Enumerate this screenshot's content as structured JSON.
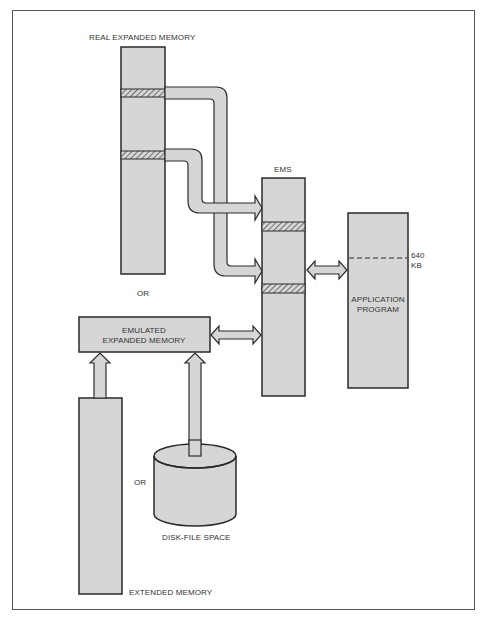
{
  "diagram": {
    "labels": {
      "real_expanded_memory": "REAL EXPANDED MEMORY",
      "ems": "EMS",
      "or_1": "OR",
      "or_2": "OR",
      "emulated_line1": "EMULATED",
      "emulated_line2": "EXPANDED MEMORY",
      "application_line1": "APPLICATION",
      "application_line2": "PROGRAM",
      "kb_640_line1": "640",
      "kb_640_line2": "KB",
      "disk_file_space": "DISK-FILE SPACE",
      "extended_memory": "EXTENDED MEMORY"
    },
    "colors": {
      "fill": "#d6d6d6",
      "stroke": "#2a2a2a",
      "hatch": "#555555",
      "text": "#333333"
    }
  },
  "caption": ""
}
